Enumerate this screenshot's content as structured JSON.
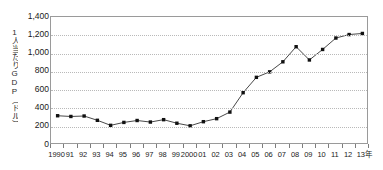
{
  "chart_data": {
    "type": "line",
    "title": "",
    "xlabel": "年",
    "ylabel": "1人当たりGDP（ドル）",
    "ylim": [
      0,
      1400
    ],
    "ytick_step": 200,
    "grid": true,
    "legend": "none",
    "marker": "square",
    "marker_color": "#111111",
    "line_color": "#333333",
    "axis_color": "#9a9a9a",
    "grid_color": "#b9b9b9",
    "x_tick_labels": [
      "1990",
      "91",
      "92",
      "93",
      "94",
      "95",
      "96",
      "97",
      "98",
      "99",
      "2000",
      "01",
      "02",
      "03",
      "04",
      "05",
      "06",
      "07",
      "08",
      "09",
      "10",
      "11",
      "12",
      "13"
    ],
    "x_axis_unit_label": "年",
    "y_tick_labels": [
      "1,400",
      "1,200",
      "1,000",
      "800",
      "600",
      "400",
      "200",
      "0"
    ],
    "y_tick_values": [
      1400,
      1200,
      1000,
      800,
      600,
      400,
      200,
      0
    ],
    "categories": [
      "1990",
      "1991",
      "1992",
      "1993",
      "1994",
      "1995",
      "1996",
      "1997",
      "1998",
      "1999",
      "2000",
      "2001",
      "2002",
      "2003",
      "2004",
      "2005",
      "2006",
      "2007",
      "2008",
      "2009",
      "2010",
      "2011",
      "2012",
      "2013"
    ],
    "values": [
      320,
      312,
      317,
      270,
      215,
      247,
      268,
      251,
      277,
      238,
      210,
      255,
      288,
      360,
      572,
      740,
      800,
      910,
      1075,
      930,
      1045,
      1170,
      1208,
      1220
    ]
  },
  "ylabel_text": "1人当たりGDP（ドル）"
}
